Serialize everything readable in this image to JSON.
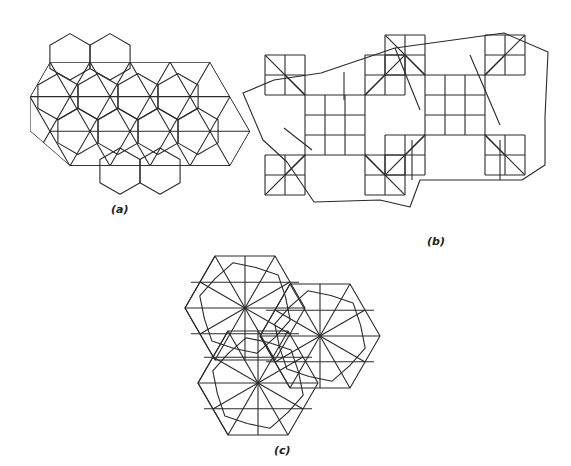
{
  "figure": {
    "panels": [
      {
        "id": "a",
        "caption": "(a)",
        "description": "hexagon and triangle tiling with 6-fold star centres"
      },
      {
        "id": "b",
        "caption": "(b)",
        "description": "square and octagon-derived tiling"
      },
      {
        "id": "c",
        "caption": "(c)",
        "description": "three interlocking hexagonal rosette patches"
      }
    ],
    "stroke_color": "#2a2a2a",
    "background": "#ffffff"
  }
}
